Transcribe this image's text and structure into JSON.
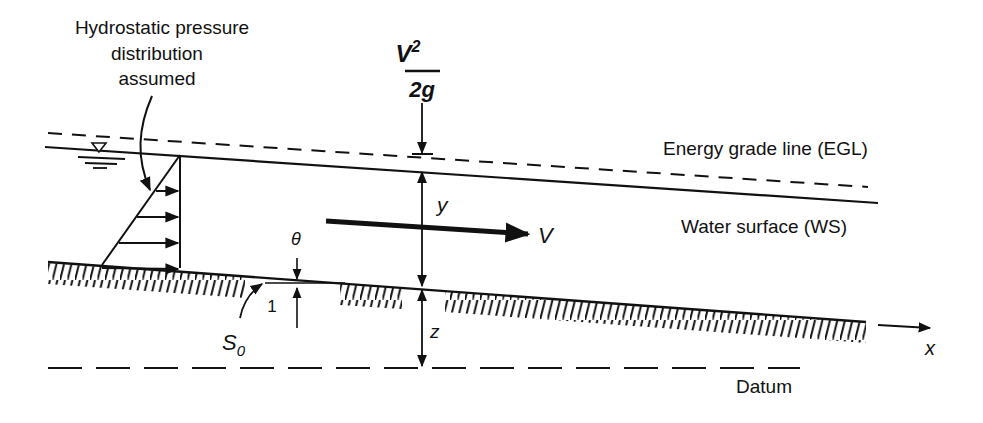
{
  "diagram": {
    "type": "open-channel-flow-energy-diagram",
    "labels": {
      "pressure_note_line1": "Hydrostatic pressure",
      "pressure_note_line2": "distribution",
      "pressure_note_line3": "assumed",
      "velocity_head_num": "V",
      "velocity_head_sup": "2",
      "velocity_head_den": "2g",
      "egl": "Energy grade line (EGL)",
      "ws": "Water surface (WS)",
      "depth": "y",
      "velocity": "V",
      "angle": "θ",
      "slope_run": "1",
      "slope_symbol": "S",
      "slope_sub": "0",
      "elevation": "z",
      "x_axis": "x",
      "datum": "Datum"
    },
    "symbols": {
      "water_surface_marker": "inverted-triangle-icon"
    },
    "colors": {
      "ink": "#111111",
      "background": "#ffffff"
    }
  }
}
